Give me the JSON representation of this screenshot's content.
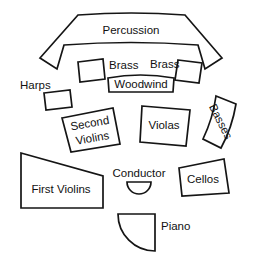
{
  "diagram": {
    "background_color": "#ffffff",
    "line_color": "#1a1a1a",
    "text_color": "#111111",
    "width": 263,
    "height": 260
  },
  "sections": {
    "percussion": {
      "label": "Percussion",
      "shape": "curved-band"
    },
    "brass_left": {
      "label": "Brass",
      "shape": "tilted-rectangle"
    },
    "brass_right": {
      "label": "Brass",
      "shape": "tilted-rectangle"
    },
    "woodwind": {
      "label": "Woodwind",
      "shape": "curved-top-rectangle"
    },
    "harps": {
      "label": "Harps",
      "shape": "tilted-rectangle"
    },
    "second_violins": {
      "label_line1": "Second",
      "label_line2": "Violins",
      "shape": "rotated-quadrilateral"
    },
    "violas": {
      "label": "Violas",
      "shape": "quadrilateral"
    },
    "basses": {
      "label": "Basses",
      "shape": "rotated-curved-quadrilateral"
    },
    "first_violins": {
      "label": "First Violins",
      "shape": "trapezoid"
    },
    "conductor": {
      "label": "Conductor",
      "shape": "semicircle"
    },
    "cellos": {
      "label": "Cellos",
      "shape": "quadrilateral"
    },
    "piano": {
      "label": "Piano",
      "shape": "quarter-circle"
    }
  }
}
